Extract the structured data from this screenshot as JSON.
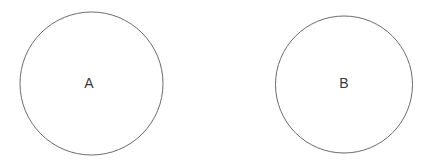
{
  "canvas": {
    "width": 438,
    "height": 168,
    "background_color": "#ffffff"
  },
  "style": {
    "stroke_color": "#6b6b6b",
    "stroke_width": 1,
    "fill_color": "#ffffff",
    "label_color": "#3a3a3a",
    "label_font_size": 14
  },
  "diagram": {
    "type": "two-disjoint-circles",
    "shape_count": 2,
    "shapes": [
      {
        "id": "circle-a",
        "label": "A",
        "cx": 91.5,
        "cy": 83.5,
        "r": 71.5,
        "label_x": 89,
        "label_y": 88
      },
      {
        "id": "circle-b",
        "label": "B",
        "cx": 344,
        "cy": 84.5,
        "r": 68.5,
        "label_x": 344,
        "label_y": 88
      }
    ]
  }
}
